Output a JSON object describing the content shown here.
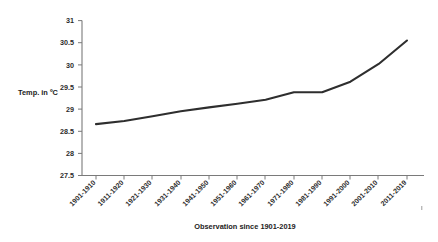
{
  "chart_data": {
    "type": "line",
    "title": "",
    "subtitle": "",
    "xlabel": "Observation since 1901-2019",
    "ylabel": "Temp. in ºC",
    "categories": [
      "1901-1910",
      "1911-1920",
      "1921-1930",
      "1931-1940",
      "1941-1950",
      "1951-1960",
      "1961-1970",
      "1971-1980",
      "1981-1990",
      "1991-2000",
      "2001-2010",
      "2011-2019"
    ],
    "values": [
      28.66,
      28.73,
      28.84,
      28.95,
      29.04,
      29.12,
      29.21,
      29.38,
      29.38,
      29.62,
      30.02,
      30.55
    ],
    "series": [
      {
        "name": "Temperature",
        "values": [
          28.66,
          28.73,
          28.84,
          28.95,
          29.04,
          29.12,
          29.21,
          29.38,
          29.38,
          29.62,
          30.02,
          30.55
        ]
      }
    ],
    "ylim": [
      27.5,
      31.0
    ],
    "ytick_step": 0.5,
    "yticks": [
      "27.5",
      "28",
      "28.5",
      "29",
      "29.5",
      "30",
      "30.5",
      "31"
    ],
    "ytick_values": [
      27.5,
      28,
      28.5,
      29,
      29.5,
      30,
      30.5,
      31
    ],
    "grid": false,
    "legend": "none",
    "legend_position": "none",
    "xtick_rotation_deg": 45,
    "line_color": "#2e2e2e",
    "axis_color": "#7a7a7a",
    "background_color": "#ffffff",
    "markers": false,
    "annotations": []
  }
}
